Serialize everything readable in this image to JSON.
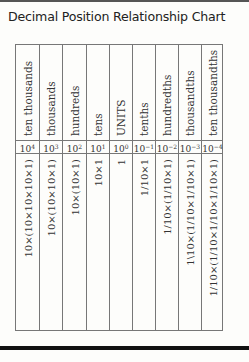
{
  "title": "Decimal Position Relationship Chart",
  "columns": [
    {
      "place": "ten thousands",
      "base": "10",
      "exp": "4",
      "expansion": "10×(10×10×10×1)"
    },
    {
      "place": "thousands",
      "base": "10",
      "exp": "3",
      "expansion": "10×(10×10×1)"
    },
    {
      "place": "hundreds",
      "base": "10",
      "exp": "2",
      "expansion": "10×(10×1)"
    },
    {
      "place": "tens",
      "base": "10",
      "exp": "1",
      "expansion": "10×1"
    },
    {
      "place": "UNITS",
      "base": "10",
      "exp": "0",
      "expansion": "1"
    },
    {
      "place": "tenths",
      "base": "10",
      "exp": "−1",
      "expansion": "1/10×1"
    },
    {
      "place": "hundredths",
      "base": "10",
      "exp": "−2",
      "expansion": "1/10×(1/10×1)"
    },
    {
      "place": "thousandths",
      "base": "10",
      "exp": "−3",
      "expansion": "1\\10×(1/10×1/10×1)"
    },
    {
      "place": "ten thousandths",
      "base": "10",
      "exp": "−4",
      "expansion": "1/10×(1/10×1/10×1/10×1)"
    }
  ]
}
